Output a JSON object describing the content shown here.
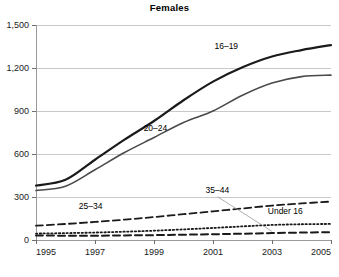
{
  "chart_data": {
    "type": "line",
    "title": "Females",
    "xlabel": "",
    "ylabel": "",
    "x": [
      1995,
      1996,
      1997,
      1998,
      1999,
      2000,
      2001,
      2002,
      2003,
      2004,
      2005
    ],
    "xlim": [
      1995,
      2005
    ],
    "ylim": [
      0,
      1500
    ],
    "xticks": [
      "1995",
      "1997",
      "1999",
      "2001",
      "2003",
      "2005"
    ],
    "xtick_values": [
      1995,
      1997,
      1999,
      2001,
      2003,
      2005
    ],
    "yticks": [
      "0",
      "300",
      "600",
      "900",
      "1,200",
      "1,500"
    ],
    "ytick_values": [
      0,
      300,
      600,
      900,
      1200,
      1500
    ],
    "grid": "horizontal",
    "legend": "inline-labels",
    "series": [
      {
        "name": "16-19",
        "label": "16–19",
        "style": "solid",
        "color": "#1a1a1a",
        "width": 2.2,
        "values": [
          380,
          420,
          560,
          700,
          830,
          975,
          1105,
          1205,
          1280,
          1325,
          1360
        ],
        "label_x": 2001.45,
        "label_y": 1330
      },
      {
        "name": "20-24",
        "label": "20–24",
        "style": "solid",
        "color": "#4a4a4a",
        "width": 1.6,
        "values": [
          345,
          375,
          490,
          610,
          715,
          820,
          900,
          1010,
          1095,
          1140,
          1150
        ],
        "label_x": 1999.05,
        "label_y": 760
      },
      {
        "name": "25-34",
        "label": "25–34",
        "style": "dashed",
        "color": "#1a1a1a",
        "width": 1.8,
        "values": [
          100,
          112,
          126,
          142,
          160,
          180,
          200,
          220,
          240,
          255,
          268
        ],
        "label_x": 1996.85,
        "label_y": 216
      },
      {
        "name": "Under 16",
        "label": "Under 16",
        "style": "dotted",
        "color": "#1a1a1a",
        "width": 1.8,
        "values": [
          45,
          48,
          52,
          58,
          65,
          74,
          84,
          95,
          105,
          110,
          112
        ],
        "label_x": 2003.45,
        "label_y": 178
      },
      {
        "name": "35-44",
        "label": "35–44",
        "style": "dashed",
        "color": "#1a1a1a",
        "width": 2.0,
        "values": [
          32,
          30,
          30,
          32,
          34,
          37,
          40,
          44,
          48,
          52,
          55
        ],
        "label_x": 2001.15,
        "label_y": 330,
        "leader_to_x": 2003.0,
        "leader_to_y": 60
      }
    ]
  },
  "plot": {
    "left": 36,
    "right": 331,
    "top": 25,
    "bottom": 240
  }
}
